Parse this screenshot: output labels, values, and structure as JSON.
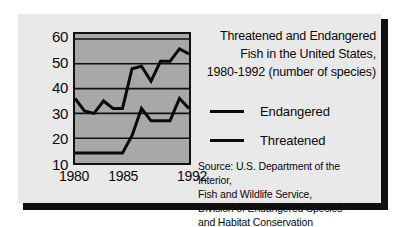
{
  "chart_data": {
    "type": "line",
    "title": "Threatened and Endangered\nFish in the United States,\n1980-1992 (number of species)",
    "xlabel": "",
    "ylabel": "",
    "x": [
      1980,
      1981,
      1982,
      1983,
      1984,
      1985,
      1986,
      1987,
      1988,
      1989,
      1990,
      1991,
      1992
    ],
    "xlim": [
      1980,
      1992
    ],
    "ylim": [
      10,
      62
    ],
    "yticks": [
      10,
      20,
      30,
      40,
      50,
      60
    ],
    "xticks": [
      1980,
      1985,
      1992
    ],
    "xtick_labels": [
      "1980",
      "1985",
      "1992"
    ],
    "ytick_labels": [
      "60",
      "50",
      "40",
      "30",
      "20",
      "10"
    ],
    "grid": "horizontal",
    "legend_position": "right",
    "series": [
      {
        "name": "Endangered",
        "color": "#0a0a0a",
        "values": [
          36,
          31,
          30,
          35,
          32,
          32,
          48,
          49,
          43,
          51,
          51,
          56,
          54
        ]
      },
      {
        "name": "Threatened",
        "color": "#0a0a0a",
        "values": [
          14,
          14,
          14,
          14,
          14,
          14,
          21,
          32,
          27,
          27,
          27,
          36,
          32
        ]
      }
    ],
    "source": "Source: U.S. Department of the Interior,\nFish and Wildlife Service,\nDivision of Endangered Species\nand Habitat Conservation"
  },
  "legend": {
    "items": [
      {
        "label": "Endangered"
      },
      {
        "label": "Threatened"
      }
    ]
  },
  "colors": {
    "panel_background": "#e9e9e9",
    "plot_background": "#a8a8a8",
    "line": "#0a0a0a",
    "border": "#111111",
    "shadow": "#111111",
    "page_background": "#ffffff"
  }
}
